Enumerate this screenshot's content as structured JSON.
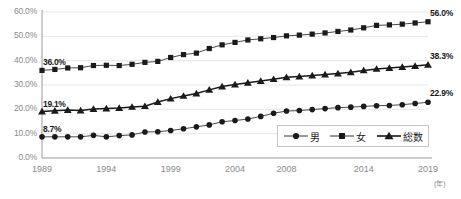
{
  "chart_data": {
    "type": "line",
    "title": "",
    "xlabel": "(年)",
    "ylabel": "",
    "x": [
      1989,
      1990,
      1991,
      1992,
      1993,
      1994,
      1995,
      1996,
      1997,
      1998,
      1999,
      2000,
      2001,
      2002,
      2003,
      2004,
      2005,
      2006,
      2007,
      2008,
      2009,
      2010,
      2011,
      2012,
      2013,
      2014,
      2015,
      2016,
      2017,
      2018,
      2019
    ],
    "ylim": [
      0,
      60
    ],
    "yticks": [
      "0.0%",
      "10.0%",
      "20.0%",
      "30.0%",
      "40.0%",
      "50.0%",
      "60.0%"
    ],
    "ytick_values": [
      0,
      10,
      20,
      30,
      40,
      50,
      60
    ],
    "xticks": [
      "1989",
      "1994",
      "1999",
      "2004",
      "2008",
      "2014",
      "2019"
    ],
    "xtick_values": [
      1989,
      1994,
      1999,
      2004,
      2008,
      2014,
      2019
    ],
    "grid": true,
    "legend_position": "bottom-right",
    "series": [
      {
        "name": "男",
        "marker": "circle",
        "color": "#1a1a1a",
        "values": [
          8.7,
          8.7,
          8.7,
          8.7,
          9.3,
          8.7,
          9.2,
          9.5,
          10.7,
          10.8,
          11.3,
          12.0,
          12.8,
          13.6,
          14.9,
          15.4,
          16.0,
          17.1,
          18.4,
          19.3,
          19.5,
          19.9,
          20.3,
          20.7,
          20.9,
          21.2,
          21.5,
          21.6,
          21.9,
          22.4,
          22.9
        ],
        "label_start": "8.7%",
        "label_end": "22.9%"
      },
      {
        "name": "女",
        "marker": "square",
        "color": "#1a1a1a",
        "values": [
          36.0,
          36.4,
          37.0,
          37.1,
          38.0,
          38.1,
          38.0,
          38.5,
          39.3,
          39.7,
          41.3,
          42.5,
          43.1,
          45.0,
          46.5,
          47.5,
          48.5,
          49.0,
          49.5,
          50.2,
          50.5,
          50.9,
          51.4,
          52.0,
          52.6,
          53.5,
          54.5,
          54.7,
          55.0,
          55.5,
          56.0
        ],
        "label_start": "36.0%",
        "label_end": "56.0%"
      },
      {
        "name": "総数",
        "marker": "triangle",
        "color": "#1a1a1a",
        "values": [
          19.1,
          19.4,
          19.7,
          19.5,
          20.1,
          20.3,
          20.5,
          21.0,
          21.3,
          23.0,
          24.4,
          25.5,
          26.5,
          28.0,
          29.4,
          30.2,
          30.9,
          31.6,
          32.4,
          33.2,
          33.5,
          33.9,
          34.3,
          34.7,
          35.2,
          36.0,
          36.6,
          37.0,
          37.4,
          37.8,
          38.3
        ],
        "label_start": "19.1%",
        "label_end": "38.3%"
      }
    ]
  },
  "axis": {
    "unit_label": "(年)"
  },
  "legend": {
    "items": [
      {
        "label": "男",
        "marker": "circle"
      },
      {
        "label": "女",
        "marker": "square"
      },
      {
        "label": "総数",
        "marker": "triangle"
      }
    ]
  }
}
